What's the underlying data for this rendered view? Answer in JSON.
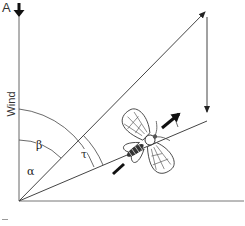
{
  "figure": {
    "panel_label": "A",
    "axis_label": "Wind",
    "angles": {
      "alpha": "α",
      "beta": "β",
      "tau": "τ"
    },
    "colors": {
      "line": "#444444",
      "arrow": "#111111",
      "background": "#ffffff"
    },
    "icons": {
      "wind_direction": "down-arrow-bold",
      "moth": "moth-illustration",
      "heading_arrow": "bold-arrow-up-right",
      "tail_arrow": "bold-dash"
    }
  }
}
